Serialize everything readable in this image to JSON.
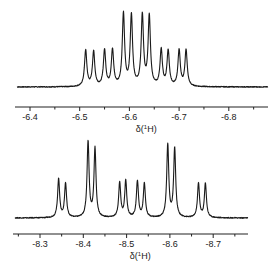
{
  "chart_data": [
    {
      "type": "line",
      "title": "",
      "xlabel": "δ(¹H)",
      "xlabel_parts": {
        "prefix": "δ(",
        "sup": "1",
        "suffix": "H)"
      },
      "ylabel": "",
      "xlim": [
        -6.37,
        -6.88
      ],
      "x_reversed": true,
      "grid": false,
      "major_ticks": [
        -6.4,
        -6.5,
        -6.6,
        -6.7,
        -6.8
      ],
      "tick_labels": [
        "-6.4",
        "-6.5",
        "-6.6",
        "-6.7",
        "-6.8"
      ],
      "minor_ticks": [
        -6.45,
        -6.55,
        -6.65,
        -6.75,
        -6.85
      ],
      "linewidth_ppm": 0.0028,
      "peaks": [
        {
          "ppm": -6.512,
          "intensity": 0.5
        },
        {
          "ppm": -6.528,
          "intensity": 0.48
        },
        {
          "ppm": -6.55,
          "intensity": 0.5
        },
        {
          "ppm": -6.566,
          "intensity": 0.5
        },
        {
          "ppm": -6.588,
          "intensity": 1.0
        },
        {
          "ppm": -6.604,
          "intensity": 0.98
        },
        {
          "ppm": -6.626,
          "intensity": 0.98
        },
        {
          "ppm": -6.64,
          "intensity": 0.97
        },
        {
          "ppm": -6.664,
          "intensity": 0.5
        },
        {
          "ppm": -6.678,
          "intensity": 0.49
        },
        {
          "ppm": -6.7,
          "intensity": 0.5
        },
        {
          "ppm": -6.714,
          "intensity": 0.5
        }
      ]
    },
    {
      "type": "line",
      "title": "",
      "xlabel": "δ(¹H)",
      "xlabel_parts": {
        "prefix": "δ(",
        "sup": "1",
        "suffix": "H)"
      },
      "ylabel": "",
      "xlim": [
        -8.24,
        -8.78
      ],
      "x_reversed": true,
      "grid": false,
      "major_ticks": [
        -8.3,
        -8.4,
        -8.5,
        -8.6,
        -8.7
      ],
      "tick_labels": [
        "-8.3",
        "-8.4",
        "-8.5",
        "-8.6",
        "-8.7"
      ],
      "minor_ticks": [
        -8.25,
        -8.35,
        -8.45,
        -8.55,
        -8.65,
        -8.75
      ],
      "linewidth_ppm": 0.0028,
      "peaks": [
        {
          "ppm": -8.343,
          "intensity": 0.51
        },
        {
          "ppm": -8.359,
          "intensity": 0.45
        },
        {
          "ppm": -8.411,
          "intensity": 1.0
        },
        {
          "ppm": -8.427,
          "intensity": 0.91
        },
        {
          "ppm": -8.484,
          "intensity": 0.46
        },
        {
          "ppm": -8.498,
          "intensity": 0.48
        },
        {
          "ppm": -8.525,
          "intensity": 0.48
        },
        {
          "ppm": -8.541,
          "intensity": 0.45
        },
        {
          "ppm": -8.595,
          "intensity": 0.96
        },
        {
          "ppm": -8.611,
          "intensity": 0.91
        },
        {
          "ppm": -8.666,
          "intensity": 0.45
        },
        {
          "ppm": -8.682,
          "intensity": 0.45
        }
      ]
    }
  ]
}
